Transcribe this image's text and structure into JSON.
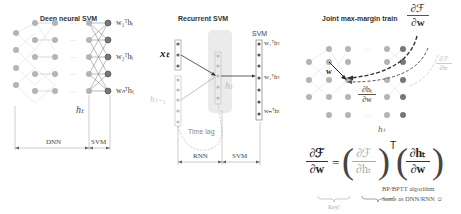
{
  "panels": {
    "deep": {
      "title": "Deep neural SVM",
      "outputs": [
        "w₁ᵀhₜ",
        "w₂ᵀhₜ",
        "wₙᵀhₜ"
      ],
      "hidden_label": "hₜ",
      "span_left": "DNN",
      "span_right": "SVM"
    },
    "recurrent": {
      "title": "Recurrent SVM",
      "svm_label": "SVM",
      "input_label": "xₜ",
      "prev_label": "hₜ₋₁",
      "hidden_label": "hₜ",
      "time_lag": "Time lag",
      "outputs": [
        "w₁ᵀhₜ",
        "w₂ᵀhₜ",
        "wₙᵀhₜ"
      ],
      "span_left": "RNN",
      "span_right": "SVM"
    },
    "joint": {
      "title": "Joint max-margin train",
      "grad_w_num": "∂ℱ",
      "grad_w_den": "∂w",
      "grad_h_num": "∂ℱ",
      "grad_h_den": "∂hₜ",
      "w_label": "w",
      "dh_num": "∂hₜ",
      "dh_den": "∂w",
      "hidden_label": "hₜ",
      "eq_lhs_num": "∂ℱ",
      "eq_lhs_den": "∂w",
      "eq_equals": "=",
      "eq_t1_num": "∂ℱ",
      "eq_t1_den": "∂hₜ",
      "eq_transpose": "T",
      "eq_t2_num": "∂hₜ",
      "eq_t2_den": "∂w",
      "key_label": "Key!",
      "note_line1": "BP/BPTT algorithm",
      "note_line2": "Same as DNN/RNN ☺"
    }
  },
  "colors": {
    "node": "#a9a9a9",
    "node_dark": "#666666",
    "light_text": "#b0b0b0",
    "dark_arrow": "#333333",
    "grey_arrow": "#bbbbbb"
  }
}
